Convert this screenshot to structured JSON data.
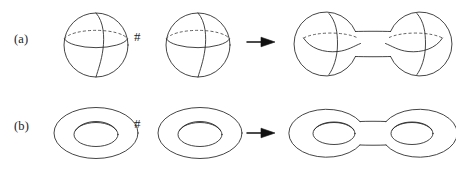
{
  "figure": {
    "caption_rows": [
      {
        "id": "a",
        "label": "(a)",
        "operator": "#",
        "arrow": "arrow-right-icon",
        "left_operand": "sphere",
        "right_operand": "sphere",
        "result": "connected-sum-of-two-spheres"
      },
      {
        "id": "b",
        "label": "(b)",
        "operator": "#",
        "arrow": "arrow-right-icon",
        "left_operand": "torus",
        "right_operand": "torus",
        "result": "genus-two-surface"
      }
    ],
    "colors": {
      "stroke": "#232323",
      "hidden_stroke": "#3a3a3a",
      "arrow": "#111111",
      "background": "#ffffff"
    }
  }
}
